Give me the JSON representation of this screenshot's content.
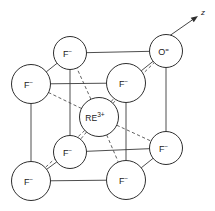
{
  "figure": {
    "background_color": "#ffffff",
    "line_color": "#3a3a3a",
    "circle_fill": "#ffffff",
    "circle_stroke": "#2e2e2e"
  },
  "axis": {
    "label": "z",
    "start": {
      "x": 152,
      "y": 48
    },
    "end": {
      "x": 198,
      "y": 16
    },
    "arrow_tip": {
      "x": 198,
      "y": 16
    }
  },
  "center_ion": {
    "name": "rare-earth-ion",
    "element": "RE",
    "charge": "3+",
    "x": 99,
    "y": 117,
    "r": 19.5
  },
  "corner_ions": [
    {
      "name": "fluoride-back-top-left",
      "element": "F",
      "charge": "−",
      "x": 70,
      "y": 53,
      "r": 16.5,
      "position": "back-top-left"
    },
    {
      "name": "oxide-back-top-right",
      "element": "O",
      "charge": "=",
      "x": 166,
      "y": 51,
      "r": 16.5,
      "position": "back-top-right"
    },
    {
      "name": "fluoride-front-top-left",
      "element": "F",
      "charge": "−",
      "x": 31,
      "y": 84,
      "r": 19.5,
      "position": "front-top-left"
    },
    {
      "name": "fluoride-front-top-right",
      "element": "F",
      "charge": "−",
      "x": 126,
      "y": 83,
      "r": 19.5,
      "position": "front-top-right"
    },
    {
      "name": "fluoride-back-bottom-left",
      "element": "F",
      "charge": "−",
      "x": 70,
      "y": 152,
      "r": 16.5,
      "position": "back-bottom-left"
    },
    {
      "name": "fluoride-back-bottom-right",
      "element": "F",
      "charge": "−",
      "x": 166,
      "y": 148,
      "r": 16.5,
      "position": "back-bottom-right"
    },
    {
      "name": "fluoride-front-bottom-left",
      "element": "F",
      "charge": "−",
      "x": 31,
      "y": 181,
      "r": 19.5,
      "position": "front-bottom-left"
    },
    {
      "name": "fluoride-front-bottom-right",
      "element": "F",
      "charge": "−",
      "x": 126,
      "y": 180,
      "r": 19.5,
      "position": "front-bottom-right"
    }
  ],
  "cube_edges": [
    {
      "name": "edge-back-top",
      "from": "back-top-left",
      "to": "back-top-right"
    },
    {
      "name": "edge-back-left-vertical",
      "from": "back-top-left",
      "to": "back-bottom-left"
    },
    {
      "name": "edge-back-right-vertical",
      "from": "back-top-right",
      "to": "back-bottom-right"
    },
    {
      "name": "edge-back-bottom",
      "from": "back-bottom-left",
      "to": "back-bottom-right"
    },
    {
      "name": "edge-front-top",
      "from": "front-top-left",
      "to": "front-top-right"
    },
    {
      "name": "edge-front-left-vertical",
      "from": "front-top-left",
      "to": "front-bottom-left"
    },
    {
      "name": "edge-front-right-vertical",
      "from": "front-top-right",
      "to": "front-bottom-right"
    },
    {
      "name": "edge-front-bottom",
      "from": "front-bottom-left",
      "to": "front-bottom-right"
    },
    {
      "name": "edge-depth-top-left",
      "from": "front-top-left",
      "to": "back-top-left"
    },
    {
      "name": "edge-depth-top-right",
      "from": "front-top-right",
      "to": "back-top-right"
    },
    {
      "name": "edge-depth-bottom-left",
      "from": "front-bottom-left",
      "to": "back-bottom-left"
    },
    {
      "name": "edge-depth-bottom-right",
      "from": "front-bottom-right",
      "to": "back-bottom-right"
    }
  ],
  "center_bonds": [
    {
      "name": "bond-to-back-top-left",
      "to": "back-top-left"
    },
    {
      "name": "bond-to-back-top-right",
      "to": "back-top-right"
    },
    {
      "name": "bond-to-front-top-left",
      "to": "front-top-left"
    },
    {
      "name": "bond-to-front-top-right",
      "to": "front-top-right"
    },
    {
      "name": "bond-to-back-bottom-left",
      "to": "back-bottom-left"
    },
    {
      "name": "bond-to-back-bottom-right",
      "to": "back-bottom-right"
    },
    {
      "name": "bond-to-front-bottom-left",
      "to": "front-bottom-left"
    },
    {
      "name": "bond-to-front-bottom-right",
      "to": "front-bottom-right"
    }
  ]
}
